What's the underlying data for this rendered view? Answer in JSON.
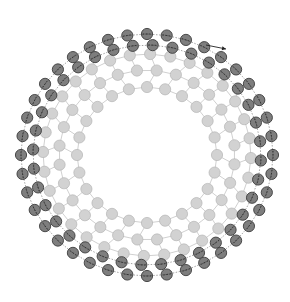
{
  "diagram": {
    "center": [
      147,
      155
    ],
    "bead_radius": 5.6,
    "colors": {
      "background": "#ffffff",
      "light_bead_fill": "#d2d2d2",
      "light_bead_stroke": "#b4b4b4",
      "dark_bead_fill": "#7e7e7e",
      "dark_bead_stroke": "#3c3c3c",
      "mesh_line": "#c4c4c4",
      "dash_line": "#2a2a2a",
      "arrow": "#222222"
    },
    "rings": [
      {
        "name": "inner-light-ring",
        "type": "light",
        "rx": 70,
        "ry": 68,
        "count": 24,
        "phase": 0.0
      },
      {
        "name": "middle-light-ring",
        "type": "light",
        "rx": 88,
        "ry": 85,
        "count": 28,
        "phase": 0.11
      },
      {
        "name": "outer-light-ring",
        "type": "light",
        "rx": 104,
        "ry": 101,
        "count": 32,
        "phase": 0.03
      },
      {
        "name": "inner-dark-ring",
        "type": "dark",
        "rx": 114,
        "ry": 110,
        "count": 36,
        "phase": 0.05
      },
      {
        "name": "outer-dark-ring",
        "type": "dark",
        "rx": 126,
        "ry": 121,
        "count": 40,
        "phase": 0.0
      }
    ],
    "arrow": {
      "from": [
        206,
        45
      ],
      "to": [
        226,
        49
      ],
      "label": ""
    }
  }
}
